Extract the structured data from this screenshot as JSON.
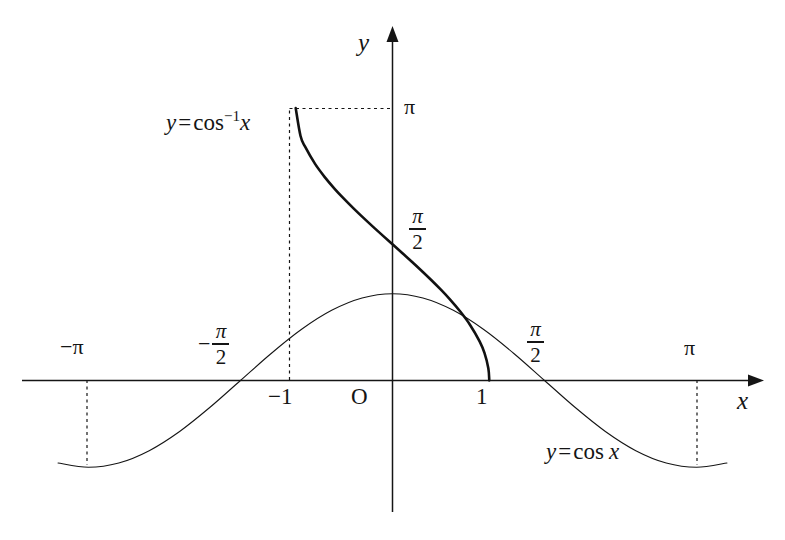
{
  "figure": {
    "background_color": "#ffffff",
    "ink_color": "#151515",
    "axes": {
      "x_axis_label": "x",
      "y_axis_label": "y",
      "origin_label": "O"
    },
    "x_ticks": [
      {
        "id": "neg-pi",
        "label": "−π",
        "value": -3.1416,
        "dashed_guide": true
      },
      {
        "id": "neg-pi-half",
        "sign": "−",
        "numerator": "π",
        "denominator": "2",
        "label": "-π/2",
        "value": -1.5708,
        "dashed_guide": false
      },
      {
        "id": "neg-one",
        "label": "−1",
        "value": -1,
        "dashed_guide": true
      },
      {
        "id": "one",
        "label": "1",
        "value": 1,
        "dashed_guide": false
      },
      {
        "id": "pi-half",
        "sign": "",
        "numerator": "π",
        "denominator": "2",
        "label": "π/2",
        "value": 1.5708,
        "dashed_guide": false
      },
      {
        "id": "pi",
        "label": "π",
        "value": 3.1416,
        "dashed_guide": true
      }
    ],
    "y_ticks": [
      {
        "id": "pi-half-y",
        "numerator": "π",
        "denominator": "2",
        "label": "π/2",
        "value": 1.5708,
        "dotted_guide": false
      },
      {
        "id": "pi-y",
        "label": "π",
        "value": 3.1416,
        "dotted_guide": true
      }
    ],
    "curve_labels": {
      "arccos": {
        "lhs": "y",
        "eq": "=",
        "fn": "cos",
        "exponent": "−1",
        "arg": "x",
        "plain": "y = cos⁻¹x"
      },
      "cosine": {
        "lhs": "y",
        "eq": "=",
        "fn": "cos",
        "arg": "x",
        "plain": "y = cos x"
      }
    }
  },
  "chart_data": {
    "type": "line",
    "xlabel": "x",
    "ylabel": "y",
    "xlim": [
      -3.45,
      3.7
    ],
    "ylim": [
      -1.35,
      3.55
    ],
    "grid": false,
    "legend_position": "inline-annotations",
    "xticks": [
      -3.1416,
      -1.5708,
      -1,
      1,
      1.5708,
      3.1416
    ],
    "xticklabels": [
      "−π",
      "−π/2",
      "−1",
      "1",
      "π/2",
      "π"
    ],
    "yticks": [
      1.5708,
      3.1416
    ],
    "yticklabels": [
      "π/2",
      "π"
    ],
    "annotations": [
      {
        "text": "y = cos⁻¹x",
        "x": -1.95,
        "y": 2.95
      },
      {
        "text": "y = cos x",
        "x": 1.75,
        "y": -0.72
      },
      {
        "text": "O",
        "x": -0.33,
        "y": -0.18
      }
    ],
    "guides": [
      {
        "type": "dashed-vertical",
        "x": -3.1416,
        "y_from": 0,
        "y_to": -1
      },
      {
        "type": "dashed-vertical",
        "x": -1,
        "y_from": 0,
        "y_to": 3.1416
      },
      {
        "type": "dashed-vertical",
        "x": 3.1416,
        "y_from": 0,
        "y_to": -1
      },
      {
        "type": "dotted-horizontal",
        "y": 3.1416,
        "x_from": -1,
        "x_to": 0
      }
    ],
    "series": [
      {
        "name": "y = cos x",
        "domain": [
          -3.45,
          3.55
        ],
        "line_width": 1.1,
        "x": [
          -3.4557,
          -3.1416,
          -2.8274,
          -2.5133,
          -2.1991,
          -1.885,
          -1.5708,
          -1.2566,
          -0.9425,
          -0.6283,
          -0.3142,
          0,
          0.3142,
          0.6283,
          0.9425,
          1.2566,
          1.5708,
          1.885,
          2.1991,
          2.5133,
          2.8274,
          3.1416,
          3.4557
        ],
        "y": [
          -0.9511,
          -1,
          -0.9511,
          -0.809,
          -0.5878,
          -0.309,
          0,
          0.309,
          0.5878,
          0.809,
          0.9511,
          1,
          0.9511,
          0.809,
          0.5878,
          0.309,
          0,
          -0.309,
          -0.5878,
          -0.809,
          -0.9511,
          -1,
          -0.9511
        ]
      },
      {
        "name": "y = cos⁻¹x",
        "domain": [
          -1,
          1
        ],
        "line_width": 2.6,
        "x": [
          -1,
          -0.95,
          -0.9,
          -0.8,
          -0.7,
          -0.6,
          -0.5,
          -0.4,
          -0.3,
          -0.2,
          -0.1,
          0,
          0.1,
          0.2,
          0.3,
          0.4,
          0.5,
          0.6,
          0.7,
          0.8,
          0.9,
          0.95,
          0.99,
          1
        ],
        "y": [
          3.1416,
          2.8198,
          2.6906,
          2.4981,
          2.3462,
          2.2143,
          2.0944,
          1.9823,
          1.8755,
          1.7722,
          1.671,
          1.5708,
          1.4706,
          1.3694,
          1.2661,
          1.1593,
          1.0472,
          0.9273,
          0.7954,
          0.6435,
          0.451,
          0.3176,
          0.1415,
          0
        ]
      }
    ],
    "intersection_point": {
      "x": 0.739,
      "y": 0.739
    }
  }
}
